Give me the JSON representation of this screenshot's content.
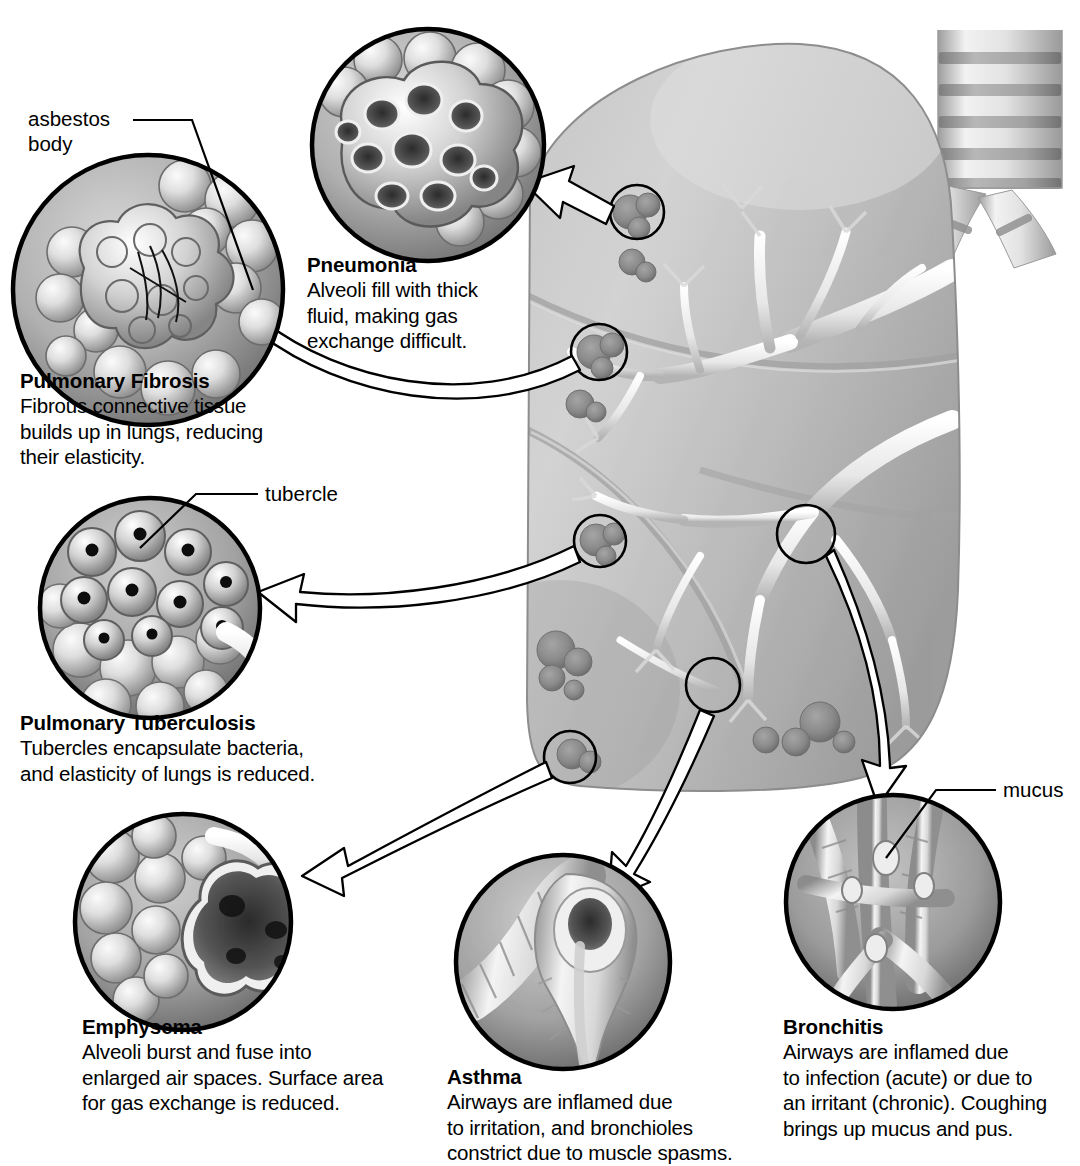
{
  "diagram": {
    "palette": {
      "ink": "#000000",
      "lung_light": "#d8d8d8",
      "lung_mid": "#b3b3b3",
      "lung_dark": "#8f8f8f",
      "inset_bg_light": "#c9c9c9",
      "inset_bg_dark": "#6e6e6e",
      "tissue_light": "#efefef",
      "tissue_shadow": "#7a7a7a",
      "lesion": "#8a8a8a",
      "arrow_fill": "#ffffff",
      "background": "#ffffff"
    }
  },
  "leader_labels": [
    {
      "id": "asbestos-body",
      "text": "asbestos\nbody"
    },
    {
      "id": "tubercle",
      "text": "tubercle"
    },
    {
      "id": "mucus",
      "text": "mucus"
    }
  ],
  "callouts": [
    {
      "id": "pneumonia",
      "title": "Pneumonia",
      "description": "Alveoli fill with thick\nfluid, making gas\nexchange difficult.",
      "inset_subject": "alveolar cluster filled with fluid"
    },
    {
      "id": "pulmonary-fibrosis",
      "title": "Pulmonary Fibrosis",
      "description": "Fibrous connective tissue\nbuilds up in lungs, reducing\ntheir elasticity.",
      "inset_subject": "alveoli with asbestos fibers"
    },
    {
      "id": "pulmonary-tuberculosis",
      "title": "Pulmonary Tuberculosis",
      "description": "Tubercles encapsulate bacteria,\nand elasticity of lungs is reduced.",
      "inset_subject": "alveoli containing dark tubercles"
    },
    {
      "id": "emphysema",
      "title": "Emphysema",
      "description": "Alveoli burst and fuse into\nenlarged air spaces. Surface area\nfor gas exchange is reduced.",
      "inset_subject": "burst alveoli forming enlarged air space"
    },
    {
      "id": "asthma",
      "title": "Asthma",
      "description": "Airways are inflamed due\nto irritation, and bronchioles\nconstrict due to muscle spasms.",
      "inset_subject": "constricted bronchiole"
    },
    {
      "id": "bronchitis",
      "title": "Bronchitis",
      "description": "Airways are inflamed due\nto infection (acute) or due to\nan irritant (chronic). Coughing\nbrings  up mucus and pus.",
      "inset_subject": "inflamed airway lined with mucus"
    }
  ],
  "anatomy": {
    "trachea": "trachea with cartilage rings",
    "bronchi": "primary bronchi",
    "lung": "left lung with lobes",
    "bronchial_tree": "branching bronchial tree",
    "lesion_markers": 6
  }
}
